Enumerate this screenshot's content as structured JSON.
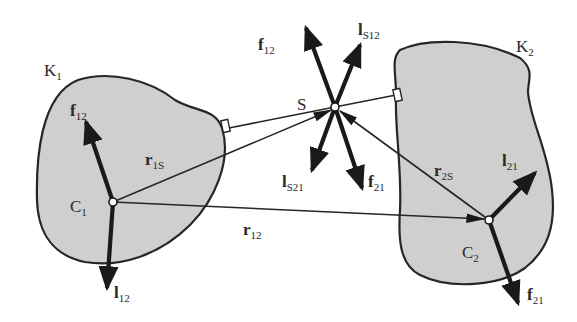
{
  "figure": {
    "type": "mechanics-free-body-diagram",
    "bodies": [
      {
        "id": "K1",
        "label": "K",
        "sub": "1",
        "centroid_label": "C",
        "centroid_sub": "1"
      },
      {
        "id": "K2",
        "label": "K",
        "sub": "2",
        "centroid_label": "C",
        "centroid_sub": "2"
      }
    ],
    "point_s": {
      "label": "S"
    },
    "vectors": {
      "r1S": {
        "label": "r",
        "sub": "1S"
      },
      "r2S": {
        "label": "r",
        "sub": "2S"
      },
      "r12": {
        "label": "r",
        "sub": "12"
      },
      "f12_at_C1": {
        "label": "f",
        "sub": "12"
      },
      "l12_at_C1": {
        "label": "l",
        "sub": "12"
      },
      "f12_at_S": {
        "label": "f",
        "sub": "12"
      },
      "lS12_at_S": {
        "label": "l",
        "sub": "S12"
      },
      "lS21_at_S": {
        "label": "l",
        "sub": "S21"
      },
      "f21_at_S": {
        "label": "f",
        "sub": "21"
      },
      "l21_at_C2": {
        "label": "l",
        "sub": "21"
      },
      "f21_at_C2": {
        "label": "f",
        "sub": "21"
      }
    },
    "colors": {
      "body_fill": "#cfcfcf",
      "stroke": "#262626",
      "background": "#ffffff"
    }
  }
}
